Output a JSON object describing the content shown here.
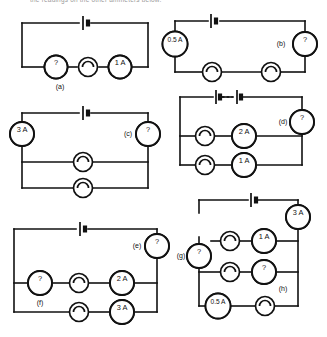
{
  "page": {
    "top_text": "the readings on the other ammeters below.",
    "width": 327,
    "height": 337,
    "ink_color": "#111111",
    "background_color": "#ffffff"
  },
  "symbols": {
    "ammeter": "ammeter-symbol",
    "bulb": "lamp-bulb-symbol",
    "cell": "battery-cell-symbol"
  },
  "circuits": [
    {
      "id": "a",
      "label": "(a)",
      "cells": 1,
      "meters": [
        {
          "name": "meter-a-unknown",
          "value": "?"
        },
        {
          "name": "meter-a-1a",
          "value": "1 A"
        }
      ],
      "bulbs": 1
    },
    {
      "id": "b",
      "label": "(b)",
      "cells": 1,
      "meters": [
        {
          "name": "meter-b-05a",
          "value": "0.5 A"
        },
        {
          "name": "meter-b-unknown",
          "value": "?"
        }
      ],
      "bulbs": 2
    },
    {
      "id": "c",
      "label": "(c)",
      "cells": 1,
      "meters": [
        {
          "name": "meter-c-3a",
          "value": "3 A"
        },
        {
          "name": "meter-c-unknown",
          "value": "?"
        }
      ],
      "bulbs": 2
    },
    {
      "id": "d",
      "label": "(d)",
      "cells": 2,
      "meters": [
        {
          "name": "meter-d-unknown",
          "value": "?"
        },
        {
          "name": "meter-d-2a",
          "value": "2 A"
        },
        {
          "name": "meter-d-1a",
          "value": "1 A"
        }
      ],
      "bulbs": 2
    },
    {
      "id": "ef",
      "label_e": "(e)",
      "label_f": "(f)",
      "cells": 1,
      "meters": [
        {
          "name": "meter-e-unknown",
          "value": "?"
        },
        {
          "name": "meter-f-unknown",
          "value": "?"
        },
        {
          "name": "meter-ef-2a",
          "value": "2 A"
        },
        {
          "name": "meter-ef-3a",
          "value": "3 A"
        }
      ],
      "bulbs": 2
    },
    {
      "id": "gh",
      "label_g": "(g)",
      "label_h": "(h)",
      "cells": 1,
      "meters": [
        {
          "name": "meter-gh-3a",
          "value": "3 A"
        },
        {
          "name": "meter-g-unknown",
          "value": "?"
        },
        {
          "name": "meter-gh-1a",
          "value": "1 A"
        },
        {
          "name": "meter-h-unknown",
          "value": "?"
        },
        {
          "name": "meter-gh-05a",
          "value": "0.5 A"
        }
      ],
      "bulbs": 3
    }
  ]
}
